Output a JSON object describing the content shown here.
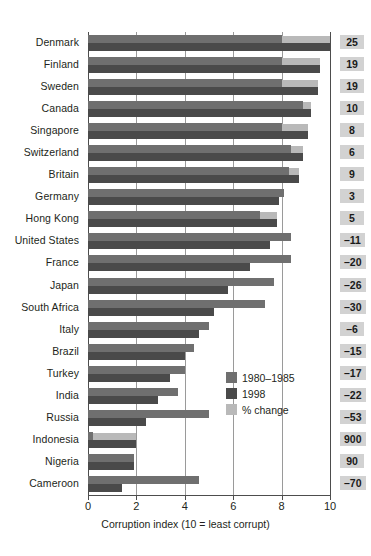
{
  "chart_data": {
    "type": "bar",
    "orientation": "horizontal",
    "title": "",
    "xlabel": "Corruption index (10 = least corrupt)",
    "ylabel": "",
    "xlim": [
      0,
      10
    ],
    "xticks": [
      0,
      2,
      4,
      6,
      8,
      10
    ],
    "xtick_labels": [
      "0",
      "2",
      "4",
      "6",
      "8",
      "10"
    ],
    "grid": true,
    "grid_axis": "x",
    "legend_position": "bottom-right",
    "categories": [
      "Denmark",
      "Finland",
      "Sweden",
      "Canada",
      "Singapore",
      "Switzerland",
      "Britain",
      "Germany",
      "Hong Kong",
      "United States",
      "France",
      "Japan",
      "South Africa",
      "Italy",
      "Brazil",
      "Turkey",
      "India",
      "Russia",
      "Indonesia",
      "Nigeria",
      "Cameroon"
    ],
    "series": [
      {
        "name": "1980–1985",
        "color": "#6f6f6f",
        "values": [
          8.0,
          8.0,
          8.0,
          8.9,
          8.0,
          8.4,
          8.3,
          8.1,
          7.1,
          8.4,
          8.4,
          7.7,
          7.3,
          5.0,
          4.4,
          4.0,
          3.7,
          5.0,
          0.2,
          1.9,
          4.6
        ]
      },
      {
        "name": "1998",
        "color": "#4a4a4a",
        "values": [
          10.0,
          9.6,
          9.5,
          9.2,
          9.1,
          8.9,
          8.7,
          7.9,
          7.8,
          7.5,
          6.7,
          5.8,
          5.2,
          4.6,
          4.0,
          3.4,
          2.9,
          2.4,
          2.0,
          1.9,
          1.4
        ]
      }
    ],
    "pct_change_series": {
      "name": "% change",
      "color": "#b9b9b9",
      "values": [
        25,
        19,
        19,
        10,
        8,
        6,
        9,
        3,
        5,
        -11,
        -20,
        -26,
        -30,
        -6,
        -15,
        -17,
        -22,
        -53,
        900,
        90,
        -70
      ],
      "display": [
        "25",
        "19",
        "19",
        "10",
        "8",
        "6",
        "9",
        "3",
        "5",
        "–11",
        "–20",
        "–26",
        "–30",
        "–6",
        "–15",
        "–17",
        "–22",
        "–53",
        "900",
        "90",
        "–70"
      ]
    },
    "legend": [
      {
        "label": "1980–1985",
        "color": "#6f6f6f"
      },
      {
        "label": "1998",
        "color": "#4a4a4a"
      },
      {
        "label": "% change",
        "color": "#b9b9b9"
      }
    ]
  }
}
